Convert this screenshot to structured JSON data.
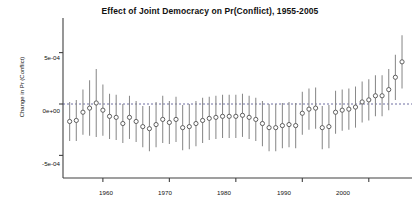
{
  "chart_data": {
    "type": "scatter",
    "title": "Effect of Joint Democracy on Pr(Conflict), 1955-2005",
    "xlabel": "",
    "ylabel": "Change in Pr (Conflict)",
    "xlim": [
      1954,
      2006.5
    ],
    "ylim": [
      -0.00072,
      0.00072
    ],
    "grid": false,
    "legend": null,
    "zero_line": 0,
    "zero_line_style": "dashed",
    "marker": "open-circle",
    "errorbar_style": "vertical-line-95ci",
    "xticks": [
      1960,
      1970,
      1980,
      1990,
      2000
    ],
    "xtick_labels": [
      "1960",
      "1970",
      "1980",
      "1990",
      "2000"
    ],
    "yticks": [
      0.0005,
      0,
      -0.0005
    ],
    "ytick_labels": [
      "5e-04",
      "0e+00",
      "-5e-04"
    ],
    "x": [
      1955,
      1956,
      1957,
      1958,
      1959,
      1960,
      1961,
      1962,
      1963,
      1964,
      1965,
      1966,
      1967,
      1968,
      1969,
      1970,
      1971,
      1972,
      1973,
      1974,
      1975,
      1976,
      1977,
      1978,
      1979,
      1980,
      1981,
      1982,
      1983,
      1984,
      1985,
      1986,
      1987,
      1988,
      1989,
      1990,
      1991,
      1992,
      1993,
      1994,
      1995,
      1996,
      1997,
      1998,
      1999,
      2000,
      2001,
      2002,
      2003,
      2004,
      2005
    ],
    "values": [
      -0.00017,
      -0.00016,
      -8e-05,
      -4e-05,
      1e-05,
      -6e-05,
      -0.00012,
      -0.00013,
      -0.00019,
      -0.00013,
      -0.00017,
      -0.00022,
      -0.00024,
      -0.0002,
      -0.00015,
      -0.00018,
      -0.00015,
      -0.00023,
      -0.00022,
      -0.00019,
      -0.00016,
      -0.00014,
      -0.00013,
      -0.00012,
      -0.00012,
      -0.00012,
      -0.00011,
      -0.00013,
      -0.00015,
      -0.00019,
      -0.00023,
      -0.00023,
      -0.00021,
      -0.0002,
      -0.00021,
      -9e-05,
      -5e-05,
      -4e-05,
      -0.00023,
      -0.00022,
      -8e-05,
      -6e-05,
      -5e-05,
      -3e-05,
      2e-05,
      4e-05,
      8e-05,
      8e-05,
      0.00014,
      0.00026,
      0.00041
    ],
    "ci_low": [
      -0.00036,
      -0.00036,
      -0.0003,
      -0.00031,
      -0.00032,
      -0.00031,
      -0.00034,
      -0.00035,
      -0.00038,
      -0.00034,
      -0.00037,
      -0.00042,
      -0.00046,
      -0.00042,
      -0.00038,
      -0.00039,
      -0.00037,
      -0.00045,
      -0.00044,
      -0.00041,
      -0.00038,
      -0.00035,
      -0.00034,
      -0.00033,
      -0.00033,
      -0.00033,
      -0.00032,
      -0.00034,
      -0.00036,
      -0.00041,
      -0.00046,
      -0.00046,
      -0.00043,
      -0.00042,
      -0.00043,
      -0.0003,
      -0.00025,
      -0.00024,
      -0.00044,
      -0.00043,
      -0.00029,
      -0.00026,
      -0.00025,
      -0.00023,
      -0.00018,
      -0.00016,
      -0.00012,
      -0.00012,
      -6e-05,
      4e-05,
      0.00015
    ],
    "ci_high": [
      2e-05,
      4e-05,
      0.00014,
      0.00023,
      0.00034,
      0.00019,
      0.0001,
      9e-05,
      0.0,
      8e-05,
      3e-05,
      -2e-05,
      -2e-05,
      2e-05,
      8e-05,
      3e-05,
      7e-05,
      -1e-05,
      0.0,
      3e-05,
      6e-05,
      7e-05,
      8e-05,
      9e-05,
      9e-05,
      9e-05,
      0.0001,
      8e-05,
      6e-05,
      3e-05,
      -0.0,
      -0.0,
      1e-05,
      2e-05,
      1e-05,
      0.00012,
      0.00015,
      0.00016,
      -2e-05,
      -1e-05,
      0.00013,
      0.00014,
      0.00015,
      0.00017,
      0.00022,
      0.00024,
      0.00028,
      0.00028,
      0.00034,
      0.00048,
      0.00067
    ]
  },
  "colors": {
    "axis": "#404040",
    "marker": "#595959",
    "errorbar": "#8a8a8a",
    "zero_line": "#4a4a8a",
    "text": "#111111",
    "background": "#ffffff"
  }
}
